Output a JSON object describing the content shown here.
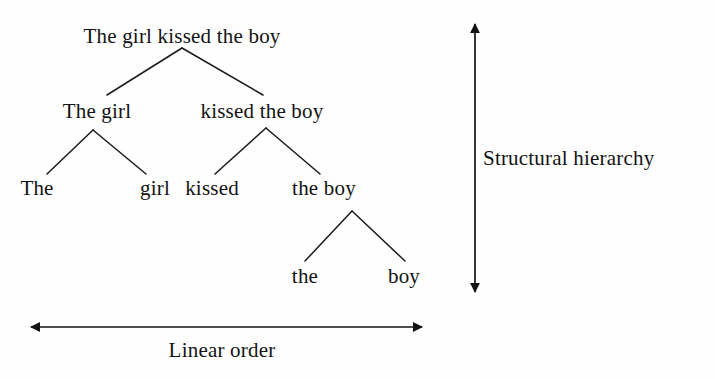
{
  "figure": {
    "background_color": "#fefefe",
    "ink_color": "#131313"
  },
  "tree": {
    "nodes": [
      {
        "id": "root",
        "label": "The girl kissed the boy",
        "level": 0,
        "x": 182,
        "y": 25
      },
      {
        "id": "np-subject",
        "label": "The girl",
        "level": 1,
        "x": 97,
        "y": 100
      },
      {
        "id": "vp",
        "label": "kissed the boy",
        "level": 1,
        "x": 262,
        "y": 100
      },
      {
        "id": "det-the-1",
        "label": "The",
        "level": 2,
        "x": 37,
        "y": 177
      },
      {
        "id": "noun-girl",
        "label": "girl",
        "level": 2,
        "x": 155,
        "y": 177
      },
      {
        "id": "verb-kissed",
        "label": "kissed",
        "level": 2,
        "x": 212,
        "y": 177
      },
      {
        "id": "np-object",
        "label": "the boy",
        "level": 2,
        "x": 324,
        "y": 177
      },
      {
        "id": "det-the-2",
        "label": "the",
        "level": 3,
        "x": 305,
        "y": 265
      },
      {
        "id": "noun-boy",
        "label": "boy",
        "level": 3,
        "x": 404,
        "y": 265
      }
    ],
    "edges": [
      {
        "from": "root",
        "to": "np-subject",
        "x1": 182,
        "y1": 48,
        "x2": 107,
        "y2": 95
      },
      {
        "from": "root",
        "to": "vp",
        "x1": 182,
        "y1": 48,
        "x2": 263,
        "y2": 95
      },
      {
        "from": "np-subject",
        "to": "det-the-1",
        "x1": 93,
        "y1": 130,
        "x2": 47,
        "y2": 174
      },
      {
        "from": "np-subject",
        "to": "noun-girl",
        "x1": 93,
        "y1": 130,
        "x2": 146,
        "y2": 174
      },
      {
        "from": "vp",
        "to": "verb-kissed",
        "x1": 266,
        "y1": 128,
        "x2": 215,
        "y2": 174
      },
      {
        "from": "vp",
        "to": "np-object",
        "x1": 266,
        "y1": 128,
        "x2": 320,
        "y2": 174
      },
      {
        "from": "np-object",
        "to": "det-the-2",
        "x1": 352,
        "y1": 211,
        "x2": 305,
        "y2": 261
      },
      {
        "from": "np-object",
        "to": "noun-boy",
        "x1": 352,
        "y1": 211,
        "x2": 405,
        "y2": 261
      }
    ]
  },
  "axes": {
    "horizontal": {
      "label": "Linear order",
      "label_x": 222,
      "label_y": 339,
      "x_start": 31,
      "x_end": 422,
      "y": 327
    },
    "vertical": {
      "label": "Structural hierarchy",
      "label_x": 483,
      "label_y": 147,
      "x": 475,
      "y_start": 24,
      "y_end": 292
    }
  }
}
